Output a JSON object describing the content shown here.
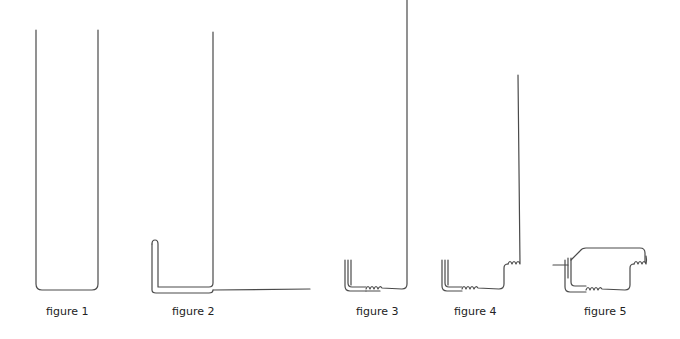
{
  "figures": [
    {
      "id": 1,
      "caption": "figure 1",
      "description": "Single wire bent into a tall U shape"
    },
    {
      "id": 2,
      "caption": "figure 2",
      "description": "Tall U wire with a short upright leg on the left and one leg bent flat to the right"
    },
    {
      "id": 3,
      "caption": "figure 3",
      "description": "Wire with twisted double upright on left, small coil on bottom run, and tall leg rising on right"
    },
    {
      "id": 4,
      "caption": "figure 4",
      "description": "Same as figure 3 with an additional coil at the right, then a tall vertical leg"
    },
    {
      "id": 5,
      "caption": "figure 5",
      "description": "Closed loop: twisted upright on left, bottom coil, right coil, wire looped back over the top to the left upright"
    }
  ],
  "style": {
    "line_color": "#4a4a4a",
    "caption_color": "#222222",
    "background": "#ffffff"
  }
}
